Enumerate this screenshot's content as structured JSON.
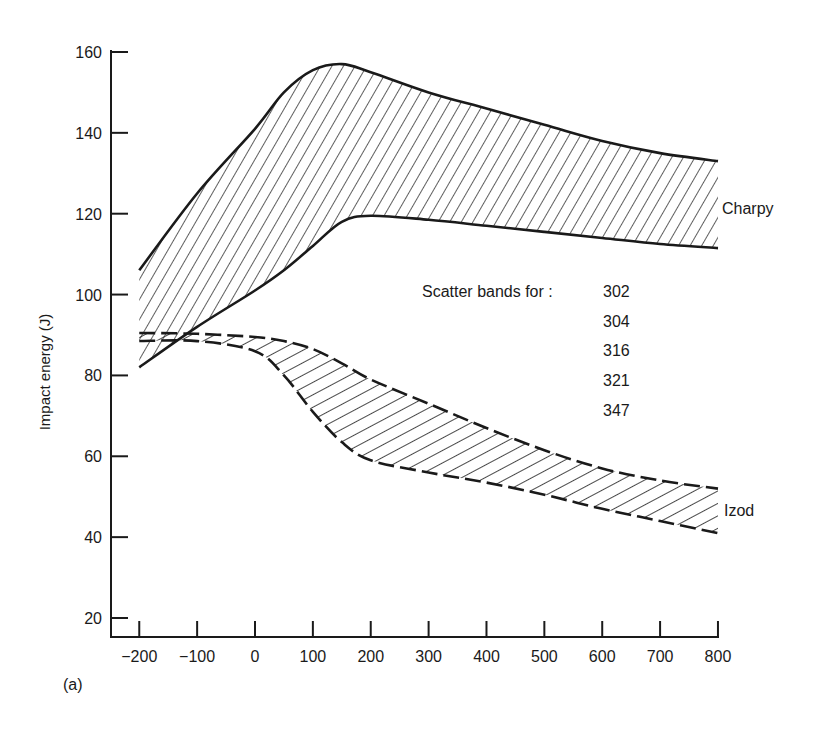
{
  "chart_data": {
    "type": "area",
    "title": "",
    "panel_label": "(a)",
    "xlabel": "",
    "ylabel": "Impact energy (J)",
    "xlim": [
      -200,
      800
    ],
    "ylim": [
      20,
      160
    ],
    "x_ticks": [
      -200,
      -100,
      0,
      100,
      200,
      300,
      400,
      500,
      600,
      700,
      800
    ],
    "y_ticks": [
      20,
      40,
      60,
      80,
      100,
      120,
      140,
      160
    ],
    "grid": false,
    "legend": {
      "text": "Scatter bands for :",
      "items": [
        "302",
        "304",
        "316",
        "321",
        "347"
      ]
    },
    "bands": [
      {
        "name": "Charpy",
        "line_style": "solid",
        "hatched": true,
        "upper": {
          "x": [
            -200,
            -100,
            0,
            50,
            100,
            150,
            200,
            300,
            400,
            500,
            600,
            700,
            800
          ],
          "y": [
            106,
            125,
            141,
            150,
            155.5,
            157,
            155,
            150,
            146,
            142,
            138,
            135,
            133
          ]
        },
        "lower": {
          "x": [
            -200,
            -100,
            0,
            50,
            100,
            150,
            200,
            300,
            400,
            500,
            600,
            700,
            800
          ],
          "y": [
            82,
            92,
            101,
            106,
            112,
            118,
            119.5,
            118.5,
            117,
            115.5,
            114,
            112.5,
            111.5
          ]
        }
      },
      {
        "name": "Izod",
        "line_style": "dashed",
        "hatched": true,
        "upper": {
          "x": [
            -200,
            -100,
            0,
            50,
            100,
            150,
            200,
            300,
            400,
            500,
            600,
            700,
            800
          ],
          "y": [
            90.5,
            90.3,
            89.5,
            88.5,
            86.5,
            83,
            79,
            73,
            67,
            61.5,
            57,
            54,
            52
          ]
        },
        "lower": {
          "x": [
            -200,
            -100,
            0,
            50,
            100,
            150,
            200,
            300,
            400,
            500,
            600,
            700,
            800
          ],
          "y": [
            88.5,
            88.5,
            86,
            80,
            71,
            63.5,
            59,
            56,
            53.5,
            50.5,
            47,
            44,
            41
          ]
        }
      }
    ]
  }
}
